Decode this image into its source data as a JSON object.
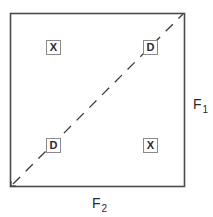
{
  "diagram": {
    "type": "2x2 factor space with diagonal",
    "frame": {
      "left": 10,
      "top": 13,
      "right": 185,
      "bottom": 187,
      "stroke": "#4a4a4a"
    },
    "diagonal": {
      "style": "dashed",
      "from": "bottom-left",
      "to": "top-right",
      "arrowhead_at": "bottom-left",
      "stroke": "#3a3a3a"
    },
    "cells": [
      {
        "position": "top-left",
        "label": "X"
      },
      {
        "position": "top-right",
        "label": "D"
      },
      {
        "position": "bottom-left",
        "label": "D"
      },
      {
        "position": "bottom-right",
        "label": "X"
      }
    ],
    "axes": {
      "vertical": {
        "base": "F",
        "subscript": "1",
        "side": "right"
      },
      "horizontal": {
        "base": "F",
        "subscript": "2",
        "side": "bottom"
      }
    }
  }
}
